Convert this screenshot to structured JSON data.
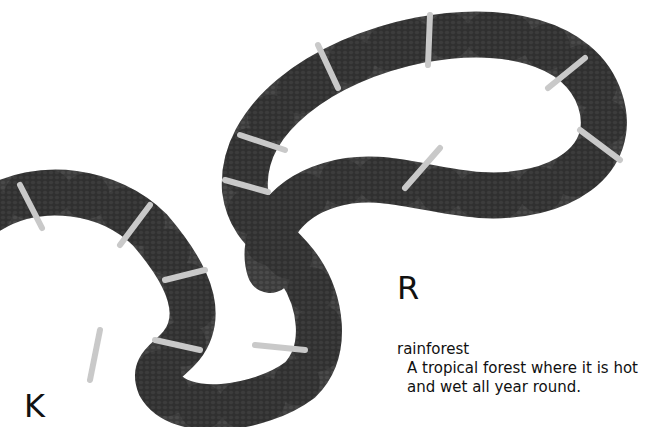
{
  "page": {
    "letters": {
      "r": "R",
      "k": "K"
    },
    "entry": {
      "term": "rainforest",
      "definition_line1": "A tropical forest where it is hot",
      "definition_line2": "and wet all year round."
    }
  },
  "image": {
    "subject": "snake-photo",
    "colors": {
      "body": "#3a3a3a",
      "band_dark": "#1e1e1e",
      "band_light": "#c8c8c8",
      "background": "#ffffff"
    }
  }
}
